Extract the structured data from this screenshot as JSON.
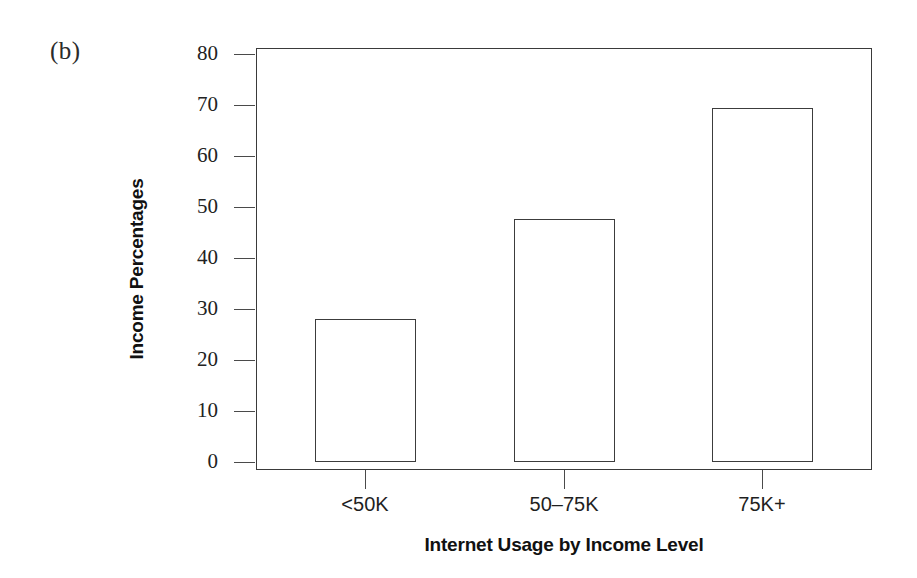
{
  "panel": {
    "label": "(b)"
  },
  "chart_data": {
    "type": "bar",
    "title": "",
    "subtitle": "",
    "xlabel": "Internet Usage by Income Level",
    "ylabel": "Income Percentages",
    "categories": [
      "<50K",
      "50–75K",
      "75K+"
    ],
    "values": [
      28,
      47.6,
      69.5
    ],
    "series": [
      {
        "name": "Income Percentages",
        "values": [
          28,
          47.6,
          69.5
        ]
      }
    ],
    "ylim": [
      0,
      80
    ],
    "ytick_labels": [
      "0",
      "10",
      "20",
      "30",
      "40",
      "50",
      "60",
      "70",
      "80"
    ],
    "ytick_values": [
      0,
      10,
      20,
      30,
      40,
      50,
      60,
      70,
      80
    ],
    "grid": false,
    "legend": false,
    "legend_position": "none",
    "bar_fill_color": "#ffffff",
    "bar_edge_color": "#3c3c3c",
    "axis_color": "#3a3a3a",
    "background_color": "#ffffff",
    "annotations": [
      "(b)"
    ]
  }
}
